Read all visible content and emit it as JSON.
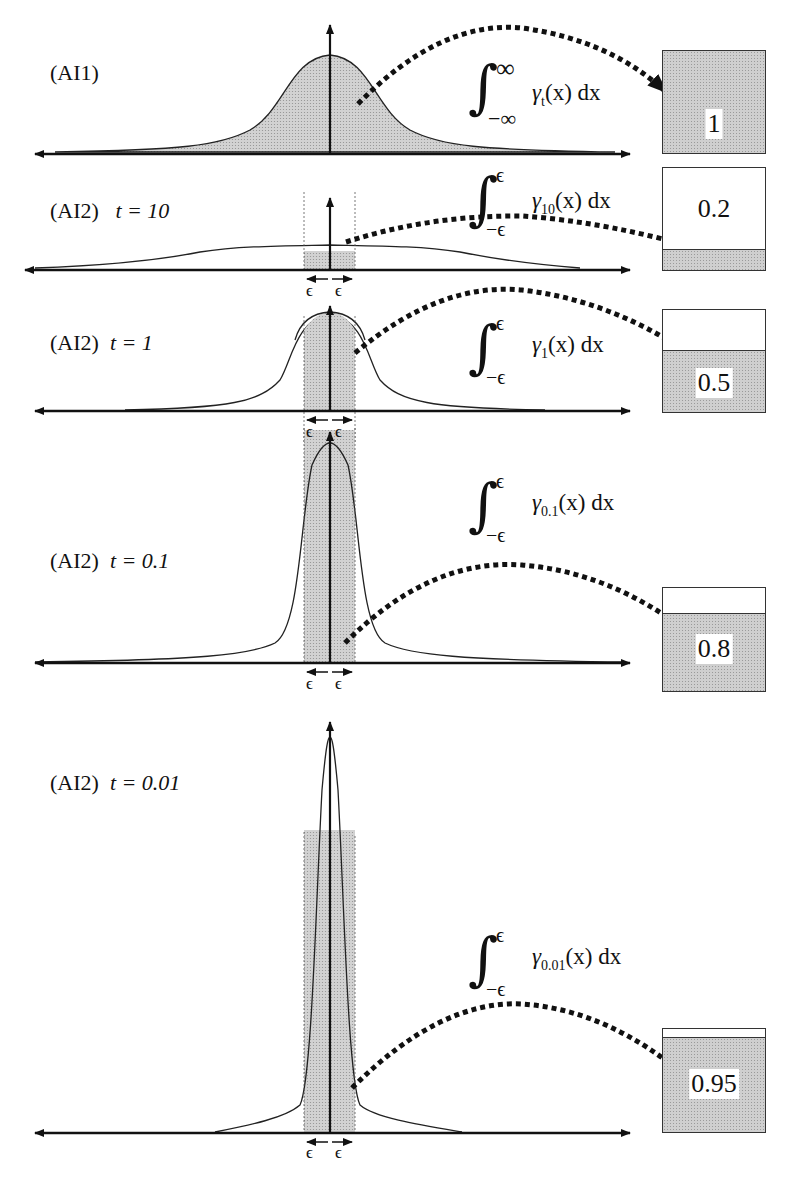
{
  "panels": [
    {
      "id": "ai1",
      "label": "(AI1)",
      "t_label": "",
      "integral": {
        "upper": "∞",
        "lower": "−∞",
        "function": "γ",
        "subscript": "t",
        "rest": "(x) dx"
      },
      "result": "1",
      "fill_fraction": 1.0
    },
    {
      "id": "ai2_t10",
      "label": "(AI2)",
      "t_label": "t  = 10",
      "integral": {
        "upper": "ϵ",
        "lower": "−ϵ",
        "function": "γ",
        "subscript": "10",
        "rest": "(x) dx"
      },
      "result": "0.2",
      "fill_fraction": 0.2
    },
    {
      "id": "ai2_t1",
      "label": "(AI2)",
      "t_label": "t = 1",
      "integral": {
        "upper": "ϵ",
        "lower": "−ϵ",
        "function": "γ",
        "subscript": "1",
        "rest": "(x) dx"
      },
      "result": "0.5",
      "fill_fraction": 0.5
    },
    {
      "id": "ai2_t01",
      "label": "(AI2)",
      "t_label": "t = 0.1",
      "integral": {
        "upper": "ϵ",
        "lower": "−ϵ",
        "function": "γ",
        "subscript": "0.1",
        "rest": "(x) dx"
      },
      "result": "0.8",
      "fill_fraction": 0.8
    },
    {
      "id": "ai2_t001",
      "label": "(AI2)",
      "t_label": "t = 0.01",
      "integral": {
        "upper": "ϵ",
        "lower": "−ϵ",
        "function": "γ",
        "subscript": "0.01",
        "rest": "(x) dx"
      },
      "result": "0.95",
      "fill_fraction": 0.95
    }
  ],
  "epsilon_marks": [
    "ϵ",
    "ϵ"
  ],
  "colors": {
    "ink": "#111111",
    "fill": "#cfcfcf",
    "box_border": "#333333"
  }
}
